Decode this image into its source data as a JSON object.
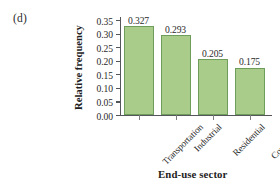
{
  "panel": {
    "label": "(d)"
  },
  "chart_data": {
    "type": "bar",
    "title": "",
    "xlabel": "End-use sector",
    "ylabel": "Relative frequency",
    "categories": [
      "Transportation",
      "Industrial",
      "Residential",
      "Commercial"
    ],
    "values": [
      0.327,
      0.293,
      0.205,
      0.175
    ],
    "value_labels": [
      "0.327",
      "0.293",
      "0.205",
      "0.175"
    ],
    "ylim": [
      0.0,
      0.35
    ],
    "ytick_labels": [
      "0.00",
      "0.05",
      "0.10",
      "0.15",
      "0.20",
      "0.25",
      "0.30",
      "0.35"
    ],
    "ytick_values": [
      0.0,
      0.05,
      0.1,
      0.15,
      0.2,
      0.25,
      0.3,
      0.35
    ],
    "grid": false,
    "legend": false,
    "bar_fill_color": "#a9cc8b",
    "bar_border_color": "#6f9e5c",
    "axis_color": "#55565a",
    "text_color": "#2b2b2b"
  }
}
